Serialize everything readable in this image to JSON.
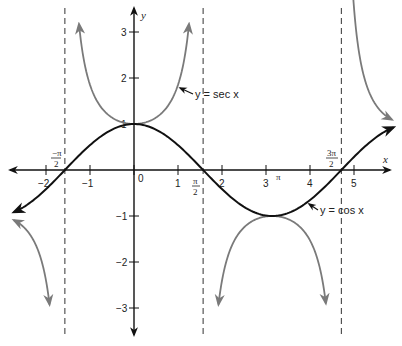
{
  "chart_data": {
    "type": "line",
    "title": "",
    "xlabel": "x",
    "ylabel": "y",
    "xlim": [
      -2.75,
      5.95
    ],
    "ylim": [
      -3.3,
      3.4
    ],
    "grid": false,
    "legend": null,
    "x_ticks": [
      {
        "value": -2,
        "label": "−2"
      },
      {
        "value": -1,
        "label": "−1"
      },
      {
        "value": 0,
        "label": "0"
      },
      {
        "value": 1,
        "label": "1"
      },
      {
        "value": 2,
        "label": "2"
      },
      {
        "value": 3,
        "label": "3"
      },
      {
        "value": 4,
        "label": "4"
      },
      {
        "value": 5,
        "label": "5"
      }
    ],
    "y_ticks": [
      {
        "value": 3,
        "label": "3"
      },
      {
        "value": 2,
        "label": "2"
      },
      {
        "value": 1,
        "label": "1"
      },
      {
        "value": -1,
        "label": "−1"
      },
      {
        "value": -2,
        "label": "−2"
      },
      {
        "value": -3,
        "label": "−3"
      }
    ],
    "special_x_labels": [
      {
        "value": -1.5708,
        "numerator": "−π",
        "denominator": "2"
      },
      {
        "value": 1.5708,
        "numerator": "π",
        "denominator": "2"
      },
      {
        "value": 3.1416,
        "label": "π"
      },
      {
        "value": 4.7124,
        "numerator": "3π",
        "denominator": "2"
      }
    ],
    "asymptotes": [
      -1.5708,
      1.5708,
      4.7124
    ],
    "series": [
      {
        "name": "y = cos x",
        "function": "cos",
        "color": "#111111",
        "domain": [
          -2.73,
          5.9
        ],
        "sample_points": [
          {
            "x": -2.73,
            "y": -0.92
          },
          {
            "x": -1.5708,
            "y": 0
          },
          {
            "x": 0,
            "y": 1
          },
          {
            "x": 1.5708,
            "y": 0
          },
          {
            "x": 3.1416,
            "y": -1
          },
          {
            "x": 4.7124,
            "y": 0
          },
          {
            "x": 5.9,
            "y": 0.93
          }
        ]
      },
      {
        "name": "y = sec x",
        "function": "sec",
        "color": "#7a7a7a",
        "branches": [
          {
            "domain": [
              -2.73,
              -1.92
            ],
            "note": "x < -π/2, negative branch"
          },
          {
            "domain": [
              -1.25,
              1.25
            ],
            "note": "central branch, minimum 1 at x=0"
          },
          {
            "domain": [
              1.92,
              4.36
            ],
            "note": "middle branch, maximum -1 at x=π"
          },
          {
            "domain": [
              4.92,
              5.86
            ],
            "note": "x > 3π/2, positive branch"
          }
        ]
      }
    ],
    "annotations": [
      {
        "text": "y = sec x",
        "points_to": {
          "x": 0.95,
          "y": 1.72
        }
      },
      {
        "text": "y = cos x",
        "points_to": {
          "x": 4.15,
          "y": -0.53
        }
      }
    ]
  },
  "labels": {
    "x_axis": "x",
    "y_axis": "y",
    "sec_label": "y = sec x",
    "cos_label": "y = cos x",
    "neg_half_pi_num": "−π",
    "half_pi_num": "π",
    "three_half_pi_num": "3π",
    "two": "2",
    "pi": "π"
  }
}
